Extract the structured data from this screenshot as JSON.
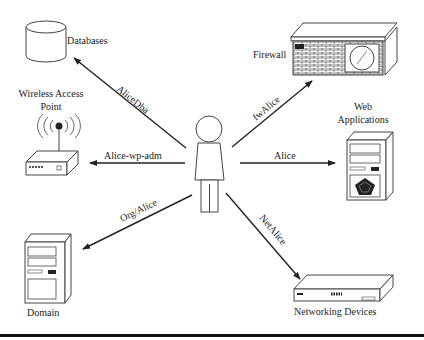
{
  "diagram": {
    "center": {
      "name": "Alice",
      "icon": "person-icon"
    },
    "nodes": [
      {
        "id": "databases",
        "label": "Databases",
        "icon": "database-icon"
      },
      {
        "id": "wap",
        "label_line1": "Wireless Access",
        "label_line2": "Point",
        "icon": "wireless-router-icon"
      },
      {
        "id": "domain",
        "label": "Domain",
        "icon": "server-tower-icon"
      },
      {
        "id": "firewall",
        "label": "Firewall",
        "icon": "firewall-icon"
      },
      {
        "id": "webapps",
        "label_line1": "Web",
        "label_line2": "Applications",
        "icon": "web-server-icon"
      },
      {
        "id": "netdev",
        "label": "Networking Devices",
        "icon": "network-switch-icon"
      }
    ],
    "edges": [
      {
        "to": "databases",
        "label": "AliceDba"
      },
      {
        "to": "wap",
        "label": "Alice-wp-adm"
      },
      {
        "to": "domain",
        "label": "Org/Alice"
      },
      {
        "to": "firewall",
        "label": "fwAlice"
      },
      {
        "to": "webapps",
        "label": "Alice"
      },
      {
        "to": "netdev",
        "label": "NetAlice"
      }
    ]
  }
}
